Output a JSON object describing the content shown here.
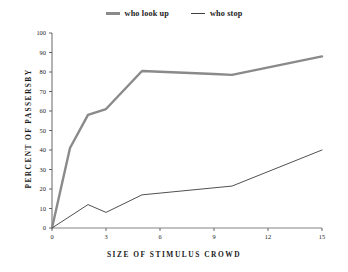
{
  "chart_data": {
    "type": "line",
    "title": "",
    "xlabel": "SIZE OF STIMULUS CROWD",
    "ylabel": "PERCENT OF PASSERSBY",
    "xlim": [
      0,
      15
    ],
    "ylim": [
      0,
      100
    ],
    "xticks": [
      "0",
      "3",
      "6",
      "9",
      "12",
      "15"
    ],
    "xtick_values": [
      0,
      3,
      6,
      9,
      12,
      15
    ],
    "yticks": [
      "0",
      "10",
      "20",
      "30",
      "40",
      "50",
      "60",
      "70",
      "80",
      "90",
      "100"
    ],
    "ytick_values": [
      0,
      10,
      20,
      30,
      40,
      50,
      60,
      70,
      80,
      90,
      100
    ],
    "grid": false,
    "legend_position": "top-center",
    "series": [
      {
        "name": "who look up",
        "color": "#8a8a8a",
        "line_width": 2.4,
        "x": [
          0,
          1,
          2,
          3,
          5,
          9,
          10,
          15
        ],
        "values": [
          0,
          41,
          58,
          61,
          80.5,
          79,
          78.5,
          88
        ]
      },
      {
        "name": "who stop",
        "color": "#3c3c3c",
        "line_width": 0.9,
        "x": [
          0,
          2,
          3,
          5,
          10,
          15
        ],
        "values": [
          0,
          12,
          8,
          17,
          21.5,
          40
        ]
      }
    ]
  },
  "legend": {
    "items": [
      {
        "label": "who look up"
      },
      {
        "label": "who stop"
      }
    ]
  },
  "axes": {
    "x_title": "SIZE OF STIMULUS CROWD",
    "y_title": "PERCENT OF PASSERSBY"
  }
}
